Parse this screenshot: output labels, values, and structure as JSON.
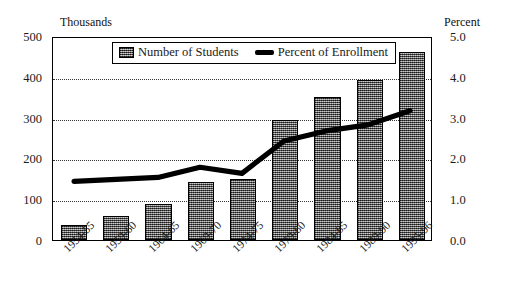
{
  "chart_data": {
    "type": "bar",
    "title": "",
    "subtitle": "",
    "categories": [
      "1954-55",
      "1959-60",
      "1964-65",
      "1969-70",
      "1974-75",
      "1979-80",
      "1984-85",
      "1989-90",
      "1995-96"
    ],
    "series": [
      {
        "name": "Number of Students",
        "type": "bar",
        "axis": "left",
        "unit": "Thousands",
        "values": [
          38,
          60,
          88,
          143,
          150,
          295,
          350,
          393,
          462
        ]
      },
      {
        "name": "Percent of Enrollment",
        "type": "line",
        "axis": "right",
        "unit": "Percent",
        "values": [
          1.45,
          1.5,
          1.55,
          1.8,
          1.65,
          2.45,
          2.7,
          2.85,
          3.2
        ]
      }
    ],
    "xlabel": "",
    "ylabel": "Thousands",
    "y2label": "Percent",
    "ylim": [
      0,
      500
    ],
    "y2lim": [
      0.0,
      5.0
    ],
    "yticks": [
      "0",
      "100",
      "200",
      "300",
      "400",
      "500"
    ],
    "y2ticks": [
      "0.0",
      "1.0",
      "2.0",
      "3.0",
      "4.0",
      "5.0"
    ],
    "grid": true,
    "grid_style": "dotted-horizontal",
    "legend_position": "top-center",
    "legend": [
      "Number of Students",
      "Percent of Enrollment"
    ],
    "colors": {
      "bar_fill": "#6f6f6f",
      "bar_edge": "#000000",
      "line": "#000000",
      "axis": "#000000",
      "grid": "#333333",
      "background": "#ffffff"
    }
  },
  "axes": {
    "left_caption": "Thousands",
    "right_caption": "Percent"
  },
  "legend": {
    "items": [
      {
        "label": "Number of Students",
        "marker": "bar-swatch-icon"
      },
      {
        "label": "Percent of Enrollment",
        "marker": "line-swatch-icon"
      }
    ]
  }
}
